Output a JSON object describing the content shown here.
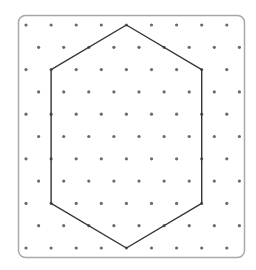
{
  "diagram": {
    "type": "isometric-dot-grid-hexagon",
    "colors": {
      "background": "#ffffff",
      "frame": "#a8a8a8",
      "dot": "#6a6a6a",
      "shape": "#333333"
    },
    "frame": {
      "x": 18.5,
      "y": 15.5,
      "width": 226,
      "height": 242,
      "radius": 7
    },
    "grid": {
      "rows": 11,
      "row_y_start": 25,
      "row_spacing": 22.3,
      "even_row_x_start": 26,
      "odd_row_x_start": 38.6,
      "col_spacing": 25.1,
      "dots_per_row": 9,
      "dot_radius": 1.6
    },
    "hexagon": {
      "vertices": [
        {
          "x": 126.4,
          "y": 25
        },
        {
          "x": 201.7,
          "y": 69.6
        },
        {
          "x": 201.7,
          "y": 203.4
        },
        {
          "x": 126.4,
          "y": 248
        },
        {
          "x": 51.1,
          "y": 203.4
        },
        {
          "x": 51.1,
          "y": 69.6
        }
      ]
    }
  }
}
